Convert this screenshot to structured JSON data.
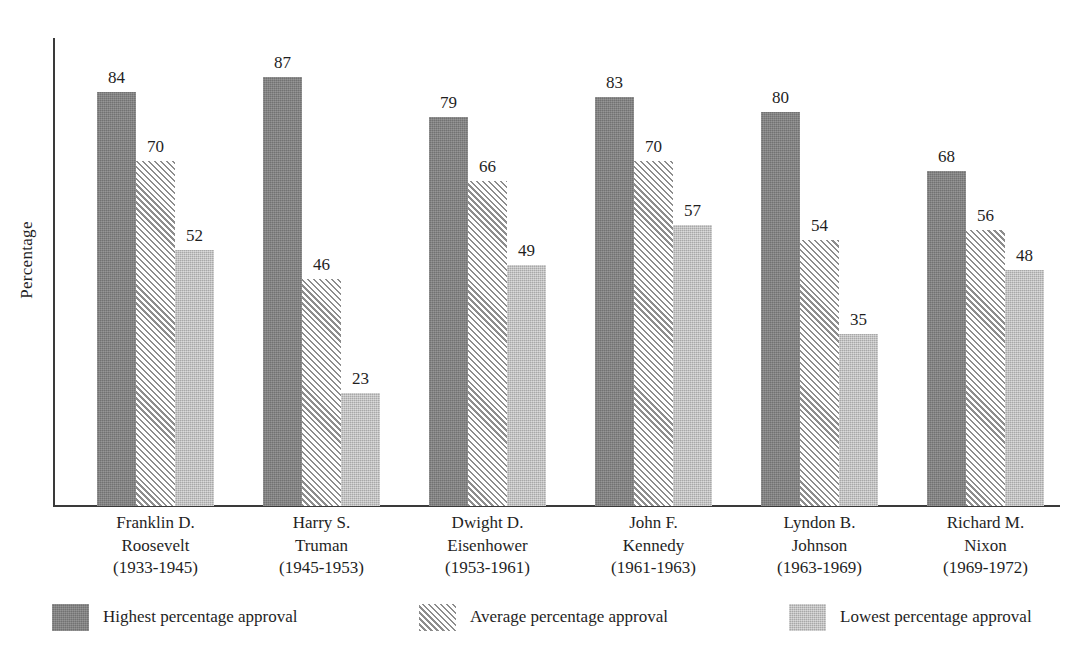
{
  "chart_data": {
    "type": "bar",
    "title": "",
    "subtitle": "",
    "xlabel": "",
    "ylabel": "Percentage",
    "ylim": [
      0,
      95
    ],
    "grid": false,
    "legend_position": "bottom",
    "categories": [
      "Franklin D. Roosevelt (1933-1945)",
      "Harry S. Truman (1945-1953)",
      "Dwight D. Eisenhower (1953-1961)",
      "John F. Kennedy (1961-1963)",
      "Lyndon B. Johnson (1963-1969)",
      "Richard M. Nixon (1969-1972)"
    ],
    "category_lines": [
      [
        "Franklin D.",
        "Roosevelt",
        "(1933-1945)"
      ],
      [
        "Harry S.",
        "Truman",
        "(1945-1953)"
      ],
      [
        "Dwight D.",
        "Eisenhower",
        "(1953-1961)"
      ],
      [
        "John F.",
        "Kennedy",
        "(1961-1963)"
      ],
      [
        "Lyndon B.",
        "Johnson",
        "(1963-1969)"
      ],
      [
        "Richard M.",
        "Nixon",
        "(1969-1972)"
      ]
    ],
    "series": [
      {
        "name": "Highest percentage approval",
        "fill": "solid-dark",
        "color": "#7e7e7e",
        "values": [
          84,
          87,
          79,
          83,
          80,
          68
        ]
      },
      {
        "name": "Average percentage approval",
        "fill": "hatch",
        "color": "#8d8d8d",
        "values": [
          70,
          46,
          66,
          70,
          54,
          56
        ]
      },
      {
        "name": "Lowest percentage approval",
        "fill": "solid-light",
        "color": "#b6b6b6",
        "values": [
          52,
          23,
          49,
          57,
          35,
          48
        ]
      }
    ]
  },
  "legend": {
    "items": [
      {
        "label": "Highest percentage approval",
        "fill": "solid-dark"
      },
      {
        "label": "Average percentage approval",
        "fill": "hatch"
      },
      {
        "label": "Lowest percentage approval",
        "fill": "solid-light"
      }
    ]
  },
  "axis": {
    "y_title": "Percentage"
  }
}
